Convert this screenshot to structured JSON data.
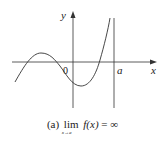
{
  "figure": {
    "axes": {
      "x_label": "x",
      "y_label": "y",
      "origin_label": "0",
      "asymptote_label": "a"
    },
    "curve": {
      "description": "cubic-like curve rising to +infinity as x approaches a from the left",
      "color": "#333333"
    },
    "caption": {
      "prefix": "(a)",
      "lim": "lim",
      "lim_sub": "x→a⁻",
      "function": "f(x)",
      "equals": "=",
      "result": "∞"
    }
  }
}
